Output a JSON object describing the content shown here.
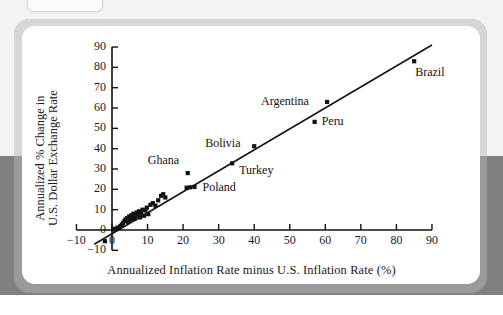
{
  "page": {
    "background_top": "#f3f3f3",
    "background_bottom": "#808080",
    "card_background": "#ffffff"
  },
  "chart_data": {
    "type": "scatter",
    "title": "",
    "xlabel": "Annualized Inflation Rate minus U.S. Inflation Rate (%)",
    "ylabel_line1": "Annualized % Change in",
    "ylabel_line2": "U.S. Dollar Exchange Rate",
    "xlim": [
      -10,
      92
    ],
    "ylim": [
      -12,
      92
    ],
    "xticks": [
      -10,
      0,
      10,
      20,
      30,
      40,
      50,
      60,
      70,
      80,
      90
    ],
    "xtick_labels": [
      "−10",
      "0",
      "10",
      "20",
      "30",
      "40",
      "50",
      "60",
      "70",
      "80",
      "90"
    ],
    "yticks": [
      -10,
      0,
      10,
      20,
      30,
      40,
      50,
      60,
      70,
      80,
      90
    ],
    "ytick_labels": [
      "−10",
      "0",
      "10",
      "20",
      "30",
      "40",
      "50",
      "60",
      "70",
      "80",
      "90"
    ],
    "grid": false,
    "legend": "none",
    "marker": "square",
    "marker_color": "#111111",
    "line_color": "#111111",
    "trendline": {
      "x0": -5.0,
      "y0": -7.0,
      "x1": 90.0,
      "y1": 91.0
    },
    "points": [
      {
        "x": -2.0,
        "y": -5.5,
        "label": ""
      },
      {
        "x": 0.3,
        "y": 0.2,
        "label": ""
      },
      {
        "x": 0.8,
        "y": 0.6,
        "label": ""
      },
      {
        "x": 1.2,
        "y": 0.4,
        "label": ""
      },
      {
        "x": 1.6,
        "y": 1.2,
        "label": ""
      },
      {
        "x": 2.0,
        "y": 1.0,
        "label": ""
      },
      {
        "x": 2.4,
        "y": 2.0,
        "label": ""
      },
      {
        "x": 2.8,
        "y": 2.6,
        "label": ""
      },
      {
        "x": 3.1,
        "y": 3.4,
        "label": ""
      },
      {
        "x": 3.5,
        "y": 4.4,
        "label": ""
      },
      {
        "x": 3.8,
        "y": 5.2,
        "label": ""
      },
      {
        "x": 4.2,
        "y": 5.8,
        "label": ""
      },
      {
        "x": 4.5,
        "y": 4.0,
        "label": ""
      },
      {
        "x": 4.8,
        "y": 6.6,
        "label": ""
      },
      {
        "x": 5.1,
        "y": 5.0,
        "label": ""
      },
      {
        "x": 5.4,
        "y": 7.2,
        "label": ""
      },
      {
        "x": 5.8,
        "y": 6.0,
        "label": ""
      },
      {
        "x": 6.0,
        "y": 8.0,
        "label": ""
      },
      {
        "x": 6.3,
        "y": 5.4,
        "label": ""
      },
      {
        "x": 6.6,
        "y": 6.8,
        "label": ""
      },
      {
        "x": 6.9,
        "y": 8.6,
        "label": ""
      },
      {
        "x": 7.2,
        "y": 7.4,
        "label": ""
      },
      {
        "x": 7.6,
        "y": 9.2,
        "label": ""
      },
      {
        "x": 7.9,
        "y": 6.2,
        "label": ""
      },
      {
        "x": 8.2,
        "y": 8.2,
        "label": ""
      },
      {
        "x": 8.6,
        "y": 10.0,
        "label": ""
      },
      {
        "x": 9.0,
        "y": 7.0,
        "label": ""
      },
      {
        "x": 9.4,
        "y": 9.6,
        "label": ""
      },
      {
        "x": 9.8,
        "y": 11.0,
        "label": ""
      },
      {
        "x": 10.2,
        "y": 7.8,
        "label": ""
      },
      {
        "x": 10.8,
        "y": 12.4,
        "label": ""
      },
      {
        "x": 11.5,
        "y": 13.2,
        "label": ""
      },
      {
        "x": 12.2,
        "y": 12.0,
        "label": ""
      },
      {
        "x": 13.0,
        "y": 14.6,
        "label": ""
      },
      {
        "x": 13.8,
        "y": 16.8,
        "label": ""
      },
      {
        "x": 14.4,
        "y": 17.6,
        "label": ""
      },
      {
        "x": 15.0,
        "y": 16.0,
        "label": ""
      },
      {
        "x": 21.0,
        "y": 20.8,
        "label": ""
      },
      {
        "x": 22.0,
        "y": 21.0,
        "label": ""
      },
      {
        "x": 23.2,
        "y": 21.2,
        "label": "Poland"
      },
      {
        "x": 21.3,
        "y": 28.0,
        "label": "Ghana"
      },
      {
        "x": 33.8,
        "y": 32.8,
        "label": "Turkey"
      },
      {
        "x": 40.0,
        "y": 41.2,
        "label": "Bolivia"
      },
      {
        "x": 57.0,
        "y": 53.2,
        "label": "Peru"
      },
      {
        "x": 60.5,
        "y": 63.0,
        "label": "Argentina"
      },
      {
        "x": 85.0,
        "y": 83.0,
        "label": "Brazil"
      }
    ],
    "annotations": [
      {
        "text": "Ghana",
        "x": 21.3,
        "y": 28.0,
        "anchor": "above-left"
      },
      {
        "text": "Poland",
        "x": 23.2,
        "y": 21.2,
        "anchor": "right"
      },
      {
        "text": "Turkey",
        "x": 33.8,
        "y": 32.8,
        "anchor": "right-below"
      },
      {
        "text": "Bolivia",
        "x": 40.0,
        "y": 41.2,
        "anchor": "left"
      },
      {
        "text": "Peru",
        "x": 57.0,
        "y": 53.2,
        "anchor": "right"
      },
      {
        "text": "Argentina",
        "x": 60.5,
        "y": 63.0,
        "anchor": "left"
      },
      {
        "text": "Brazil",
        "x": 85.0,
        "y": 83.0,
        "anchor": "below-right"
      }
    ]
  }
}
